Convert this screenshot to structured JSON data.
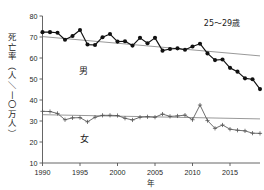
{
  "chart_data": {
    "type": "line",
    "title": "",
    "annotation": "25〜29歳",
    "xlabel": "年",
    "ylabel": "死亡率（人／一〇万人）",
    "ylabel_chars": [
      "死",
      "亡",
      "率",
      "（",
      "人",
      "／",
      "一",
      "〇",
      "万",
      "人",
      "）"
    ],
    "xlim": [
      1990,
      2019
    ],
    "ylim": [
      10,
      80
    ],
    "xticks": [
      1990,
      1995,
      2000,
      2005,
      2010,
      2015
    ],
    "yticks": [
      10,
      20,
      30,
      40,
      50,
      60,
      70,
      80
    ],
    "grid": false,
    "legend_position": "inline-labels",
    "x": [
      1990,
      1991,
      1992,
      1993,
      1994,
      1995,
      1996,
      1997,
      1998,
      1999,
      2000,
      2001,
      2002,
      2003,
      2004,
      2005,
      2006,
      2007,
      2008,
      2009,
      2010,
      2011,
      2012,
      2013,
      2014,
      2015,
      2016,
      2017,
      2018,
      2019
    ],
    "series": [
      {
        "name": "男",
        "label": "男",
        "color": "#111111",
        "marker": "filled-circle",
        "values": [
          72.3,
          72.3,
          72.0,
          68.7,
          70.5,
          73.3,
          66.4,
          66.2,
          69.9,
          71.4,
          67.8,
          68.0,
          65.9,
          69.6,
          67.0,
          69.6,
          63.5,
          64.3,
          64.6,
          63.9,
          65.5,
          66.8,
          62.2,
          59.0,
          59.3,
          55.3,
          53.5,
          50.3,
          49.9,
          45.2
        ],
        "trend": {
          "x": [
            1990,
            2019
          ],
          "y": [
            70.2,
            61.0
          ]
        }
      },
      {
        "name": "女",
        "label": "女",
        "color": "#555555",
        "marker": "cross",
        "values": [
          34.6,
          34.5,
          33.6,
          30.6,
          31.5,
          31.6,
          29.6,
          31.8,
          32.7,
          32.7,
          32.6,
          31.3,
          30.5,
          31.8,
          32.0,
          31.8,
          33.3,
          32.2,
          32.4,
          32.8,
          30.6,
          37.6,
          30.2,
          26.5,
          28.1,
          26.1,
          25.6,
          25.3,
          24.2,
          24.1
        ],
        "trend": {
          "x": [
            1990,
            2019
          ],
          "y": [
            33.0,
            31.0
          ]
        }
      }
    ]
  },
  "labels": {
    "male_series_label": "男",
    "female_series_label": "女",
    "age_group_annotation": "25〜29歳",
    "x_axis_title": "年"
  }
}
